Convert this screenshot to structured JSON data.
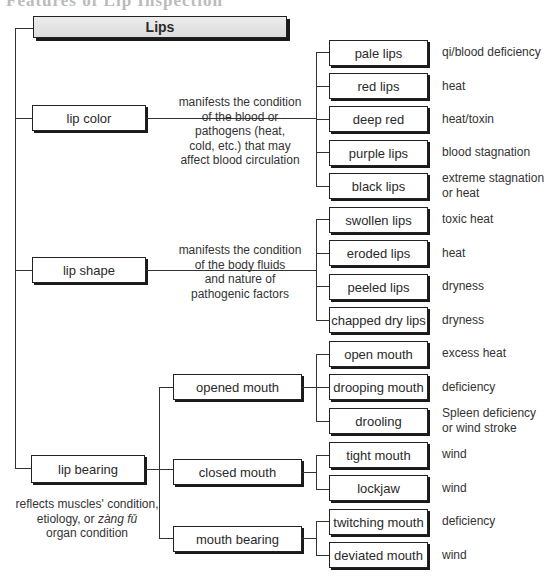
{
  "heading_partial": "Features of Lip Inspection",
  "root": {
    "label": "Lips"
  },
  "categories": [
    {
      "label": "lip color",
      "description": [
        "manifests the condition",
        "of the blood or",
        "pathogens (heat,",
        "cold, etc.) that may",
        "affect blood circulation"
      ],
      "items": [
        {
          "label": "pale lips",
          "meaning": "qi/blood deficiency"
        },
        {
          "label": "red lips",
          "meaning": "heat"
        },
        {
          "label": "deep red",
          "meaning": "heat/toxin"
        },
        {
          "label": "purple lips",
          "meaning": "blood stagnation"
        },
        {
          "label": "black lips",
          "meaning": "extreme stagnation or heat"
        }
      ]
    },
    {
      "label": "lip shape",
      "description": [
        "manifests the condition",
        "of the body fluids",
        "and nature of",
        "pathogenic factors"
      ],
      "items": [
        {
          "label": "swollen lips",
          "meaning": "toxic heat"
        },
        {
          "label": "eroded lips",
          "meaning": "heat"
        },
        {
          "label": "peeled lips",
          "meaning": "dryness"
        },
        {
          "label": "chapped dry lips",
          "meaning": "dryness"
        }
      ]
    },
    {
      "label": "lip bearing",
      "description": [
        "reflects muscles' condition,",
        "etiology, or",
        "zàng fǔ",
        "organ condition"
      ],
      "subgroups": [
        {
          "label": "opened mouth",
          "items": [
            {
              "label": "open mouth",
              "meaning": "excess heat"
            },
            {
              "label": "drooping mouth",
              "meaning": "deficiency"
            },
            {
              "label": "drooling",
              "meaning": "Spleen deficiency or wind stroke"
            }
          ]
        },
        {
          "label": "closed mouth",
          "items": [
            {
              "label": "tight mouth",
              "meaning": "wind"
            },
            {
              "label": "lockjaw",
              "meaning": "wind"
            }
          ]
        },
        {
          "label": "mouth bearing",
          "items": [
            {
              "label": "twitching mouth",
              "meaning": "deficiency"
            },
            {
              "label": "deviated mouth",
              "meaning": "wind"
            }
          ]
        }
      ]
    }
  ],
  "result_lines": {
    "black_lips": [
      "extreme stagnation",
      "or heat"
    ],
    "drooling": [
      "Spleen deficiency",
      "or wind stroke"
    ]
  }
}
